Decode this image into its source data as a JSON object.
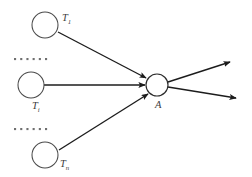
{
  "diagram": {
    "type": "node-link-graph",
    "background_color": "#ffffff",
    "stroke_color": "#1c1c1c",
    "node_stroke_color": "#4a4a4a",
    "label_color": "#3d3d3d",
    "ellipsis_color": "#6f6f6f",
    "source_nodes": [
      {
        "id": "node-t1",
        "label_base": "T",
        "label_sub": "1",
        "cx": 45,
        "cy": 25,
        "rx": 13,
        "ry": 13,
        "label_x": 62,
        "label_y": 21
      },
      {
        "id": "node-ti",
        "label_base": "T",
        "label_sub": "i",
        "cx": 31,
        "cy": 85,
        "rx": 13,
        "ry": 13,
        "label_x": 32,
        "label_y": 109
      },
      {
        "id": "node-tn",
        "label_base": "T",
        "label_sub": "n",
        "cx": 45,
        "cy": 155,
        "rx": 13,
        "ry": 13,
        "label_x": 60,
        "label_y": 167
      }
    ],
    "hub_node": {
      "id": "node-a",
      "label_base": "A",
      "label_sub": "",
      "cx": 157,
      "cy": 85,
      "rx": 11,
      "ry": 11,
      "label_x": 155,
      "label_y": 108
    },
    "ellipses": [
      {
        "id": "ellipsis-upper",
        "x": 14,
        "y": 58,
        "dot_count": 6
      },
      {
        "id": "ellipsis-lower",
        "x": 14,
        "y": 128,
        "dot_count": 6
      }
    ],
    "incoming_edges": [
      {
        "id": "edge-t1-a",
        "x1": 58,
        "y1": 32,
        "x2": 146,
        "y2": 78
      },
      {
        "id": "edge-ti-a",
        "x1": 44,
        "y1": 85,
        "x2": 145,
        "y2": 85
      },
      {
        "id": "edge-tn-a",
        "x1": 59,
        "y1": 150,
        "x2": 148,
        "y2": 94
      }
    ],
    "outgoing_edges": [
      {
        "id": "edge-a-out-upper",
        "x1": 168,
        "y1": 82,
        "x2": 230,
        "y2": 62
      },
      {
        "id": "edge-a-out-lower",
        "x1": 168,
        "y1": 87,
        "x2": 236,
        "y2": 98
      }
    ]
  }
}
